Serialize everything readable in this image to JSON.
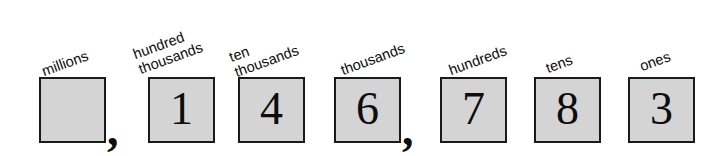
{
  "figure": {
    "name": "place-value-chart",
    "kind": "place value chart",
    "number_digits": [
      "",
      "1",
      "4",
      "6",
      "7",
      "8",
      "3"
    ],
    "separator": ",",
    "colors": {
      "box_fill": "#d4d4d4",
      "box_border": "#1a1a1a",
      "text": "#0d0d0d",
      "background": "#ffffff"
    },
    "label_rotation_deg": -20,
    "cells": [
      {
        "id": "millions",
        "label_lines": [
          "millions"
        ],
        "digit": "",
        "box": {
          "x": 39,
          "y": 77,
          "w": 67,
          "h": 66
        },
        "label": {
          "x": 45,
          "y": 63
        },
        "comma_after": true,
        "comma": {
          "x": 107,
          "y": 107
        }
      },
      {
        "id": "hundred-thousands",
        "label_lines": [
          "hundred",
          "thousands"
        ],
        "digit": "1",
        "box": {
          "x": 148,
          "y": 77,
          "w": 67,
          "h": 66
        },
        "label": {
          "x": 142,
          "y": 45
        },
        "comma_after": false
      },
      {
        "id": "ten-thousands",
        "label_lines": [
          "ten",
          "thousands"
        ],
        "digit": "4",
        "box": {
          "x": 238,
          "y": 77,
          "w": 67,
          "h": 66
        },
        "label": {
          "x": 238,
          "y": 48
        },
        "comma_after": false
      },
      {
        "id": "thousands",
        "label_lines": [
          "thousands"
        ],
        "digit": "6",
        "box": {
          "x": 334,
          "y": 77,
          "w": 67,
          "h": 66
        },
        "label": {
          "x": 344,
          "y": 62
        },
        "comma_after": true,
        "comma": {
          "x": 402,
          "y": 107
        }
      },
      {
        "id": "hundreds",
        "label_lines": [
          "hundreds"
        ],
        "digit": "7",
        "box": {
          "x": 440,
          "y": 77,
          "w": 67,
          "h": 66
        },
        "label": {
          "x": 452,
          "y": 62
        },
        "comma_after": false
      },
      {
        "id": "tens",
        "label_lines": [
          "tens"
        ],
        "digit": "8",
        "box": {
          "x": 534,
          "y": 77,
          "w": 67,
          "h": 66
        },
        "label": {
          "x": 549,
          "y": 60
        },
        "comma_after": false
      },
      {
        "id": "ones",
        "label_lines": [
          "ones"
        ],
        "digit": "3",
        "box": {
          "x": 628,
          "y": 77,
          "w": 67,
          "h": 66
        },
        "label": {
          "x": 643,
          "y": 58
        },
        "comma_after": false
      }
    ]
  }
}
